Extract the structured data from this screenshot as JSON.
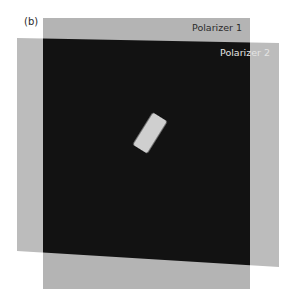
{
  "figure": {
    "panel_label": "(b)",
    "polarizer_1": {
      "label": "Polarizer 1",
      "color": "#b4b4b4",
      "corners": [
        [
          43,
          18
        ],
        [
          250,
          18
        ],
        [
          250,
          289
        ],
        [
          43,
          289
        ]
      ]
    },
    "polarizer_2": {
      "label": "Polarizer 2",
      "color": "#bcbcbc",
      "corners": [
        [
          17,
          38
        ],
        [
          279,
          43
        ],
        [
          279,
          267
        ],
        [
          17,
          251
        ]
      ]
    },
    "overlap_color": "#121212",
    "sample": {
      "description": "bright rotated rectangular sample between crossed polarizers",
      "color": "#cfcfcf",
      "center": [
        150,
        133
      ],
      "width": 17,
      "height": 38,
      "rotation_deg": 32
    }
  }
}
